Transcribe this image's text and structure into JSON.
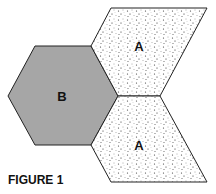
{
  "figure": {
    "caption": "FIGURE 1",
    "shapes": [
      {
        "id": "hexagon",
        "label": "B",
        "fill": "#a6a6a6",
        "pattern": "solid"
      },
      {
        "id": "rhombus-top",
        "label": "A",
        "fill": "#ffffff",
        "pattern": "stippled"
      },
      {
        "id": "rhombus-bottom",
        "label": "A",
        "fill": "#ffffff",
        "pattern": "stippled"
      }
    ]
  }
}
